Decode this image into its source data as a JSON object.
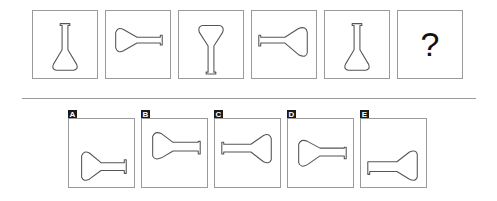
{
  "puzzle": {
    "question_sequence": [
      {
        "index": 1,
        "figure": "flask-upright",
        "description": "Flask, neck up, base down"
      },
      {
        "index": 2,
        "figure": "flask-rotated-right",
        "description": "Flask, base left, neck right"
      },
      {
        "index": 3,
        "figure": "flask-inverted",
        "description": "Flask, base up, neck down"
      },
      {
        "index": 4,
        "figure": "flask-rotated-left",
        "description": "Flask, neck left, base right"
      },
      {
        "index": 5,
        "figure": "flask-upright",
        "description": "Flask, neck up, base down"
      },
      {
        "index": 6,
        "figure": "unknown",
        "label": "?"
      }
    ],
    "answer_options": [
      {
        "label": "A",
        "figure": "flask-horizontal-base-left-low"
      },
      {
        "label": "B",
        "figure": "flask-horizontal-base-left-high"
      },
      {
        "label": "C",
        "figure": "flask-horizontal-base-right"
      },
      {
        "label": "D",
        "figure": "flask-horizontal-base-left-mid"
      },
      {
        "label": "E",
        "figure": "flask-tilted-base-right-low"
      }
    ]
  }
}
